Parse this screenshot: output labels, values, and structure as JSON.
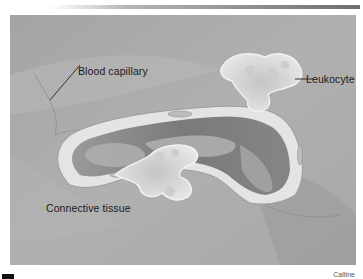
{
  "figure": {
    "labels": {
      "capillary": "Blood capillary",
      "leukocyte": "Leukocyte",
      "connective": "Connective tissue"
    },
    "credit": "Caltine",
    "colors": {
      "background_tissue": "#a9a9a9",
      "dark_tissue": "#7d7d7d",
      "capillary_wall": "#e6e6e6",
      "lumen": "#8a8a8a",
      "cell_fill": "#d9d9d9",
      "label_text": "#1a1a1a"
    }
  }
}
